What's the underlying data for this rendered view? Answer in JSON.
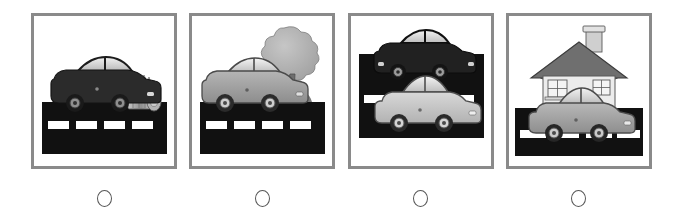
{
  "page": {
    "type": "multiple-choice-picture-question",
    "background_color": "#ffffff",
    "frame_color": "#8a8a8a",
    "option_count": 4
  },
  "palette": {
    "road_black": "#111111",
    "road_dash_white": "#ffffff",
    "car_dark": "#2b2b2b",
    "car_gray": "#9a9a9a",
    "car_light": "#c9c9c9",
    "window_light": "#e6e6e6",
    "window_shade": "#b8b8b8",
    "outline": "#3a3a3a",
    "tree_foliage": "#b0b0b0",
    "tree_trunk": "#6e6e6e",
    "house_wall": "#e9e9e9",
    "house_roof": "#6f6f6f",
    "trash_can": "#9c9c9c"
  },
  "options": [
    {
      "id": "option-a",
      "index": 1,
      "radio_label": "",
      "selected": false,
      "scene_name": "dark-car-on-road-with-trash-can",
      "objects": [
        "road",
        "dark-car",
        "trash-can"
      ]
    },
    {
      "id": "option-b",
      "index": 2,
      "radio_label": "",
      "selected": false,
      "scene_name": "gray-car-on-road-with-tree",
      "objects": [
        "road",
        "gray-car",
        "tree"
      ]
    },
    {
      "id": "option-c",
      "index": 3,
      "radio_label": "",
      "selected": false,
      "scene_name": "two-cars-on-road",
      "objects": [
        "road",
        "dark-car",
        "light-car"
      ]
    },
    {
      "id": "option-d",
      "index": 4,
      "radio_label": "",
      "selected": false,
      "scene_name": "gray-car-on-road-with-house",
      "objects": [
        "road",
        "gray-car",
        "house"
      ]
    }
  ]
}
